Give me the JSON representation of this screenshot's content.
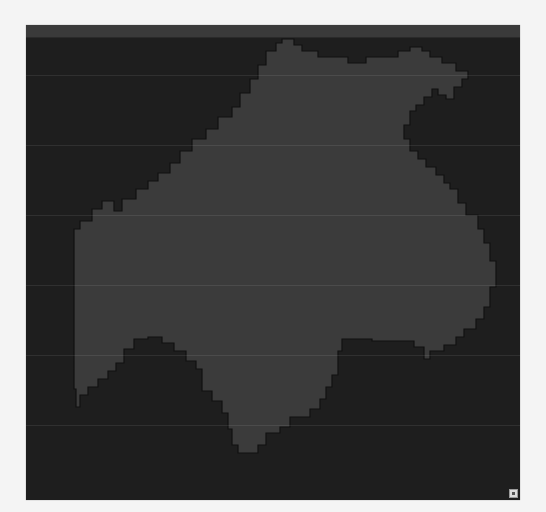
{
  "map": {
    "background_color": "#1e1e1e",
    "topbar_color": "#3a3a3a",
    "region_fill": "#3b3b3b",
    "region_stroke": "#111111",
    "region_name": "highlighted-region"
  },
  "controls": {
    "resize_handle_icon": "resize-corner-icon"
  }
}
